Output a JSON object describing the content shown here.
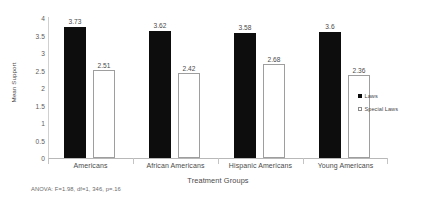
{
  "chart_data": {
    "type": "bar",
    "title": "",
    "xlabel": "Treatment Groups",
    "ylabel": "Mean Support",
    "categories": [
      "Americans",
      "African Americans",
      "Hispanic Americans",
      "Young Americans"
    ],
    "series": [
      {
        "name": "Laws",
        "values": [
          3.73,
          3.62,
          3.58,
          3.6
        ],
        "color": "#0d0d0d",
        "style": "filled"
      },
      {
        "name": "Special Laws",
        "values": [
          2.51,
          2.42,
          2.68,
          2.36
        ],
        "color": "#ffffff",
        "style": "outlined"
      }
    ],
    "ylim": [
      0,
      4
    ],
    "yticks": [
      "0",
      "0.5",
      "1",
      "1.5",
      "2",
      "2.5",
      "3",
      "3.5",
      "4"
    ],
    "ytick_values": [
      0,
      0.5,
      1,
      1.5,
      2,
      2.5,
      3,
      3.5,
      4
    ],
    "grid": false,
    "legend_position": "right",
    "data_labels": [
      [
        "3.73",
        "2.51"
      ],
      [
        "3.62",
        "2.42"
      ],
      [
        "3.58",
        "2.68"
      ],
      [
        "3.6",
        "2.36"
      ]
    ],
    "annotation": "ANOVA: F=1.98, df=1, 346, p=.16"
  },
  "colors": {
    "laws": "#0d0d0d",
    "special_laws": "#ffffff",
    "axis": "#b8b8b8",
    "text": "#4a4a4a"
  }
}
